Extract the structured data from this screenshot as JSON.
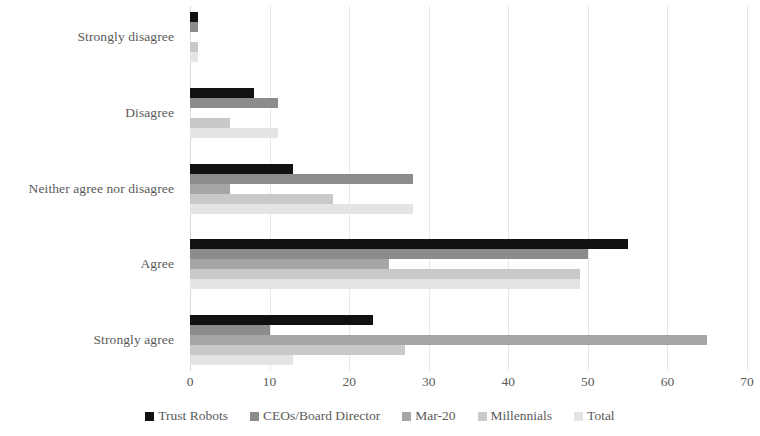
{
  "chart_data": {
    "type": "bar",
    "orientation": "horizontal",
    "title": "",
    "subtitle": "",
    "xlabel": "",
    "ylabel": "",
    "xlim": [
      0,
      70
    ],
    "xticks": [
      0,
      10,
      20,
      30,
      40,
      50,
      60,
      70
    ],
    "xtick_labels": [
      "0",
      "10",
      "20",
      "30",
      "40",
      "50",
      "60",
      "70"
    ],
    "grid": true,
    "grid_axis": "x",
    "legend_position": "bottom",
    "categories": [
      "Strongly disagree",
      "Disagree",
      "Neither agree nor disagree",
      "Agree",
      "Strongly agree"
    ],
    "series": [
      {
        "name": "Trust Robots",
        "color": "#111111",
        "values": [
          1,
          8,
          13,
          55,
          23
        ]
      },
      {
        "name": "CEOs/Board Director",
        "color": "#8c8c8c",
        "values": [
          1,
          11,
          28,
          50,
          10
        ]
      },
      {
        "name": "Mar-20",
        "color": "#a6a6a6",
        "values": [
          0,
          0,
          5,
          25,
          65
        ]
      },
      {
        "name": "Millennials",
        "color": "#c9c9c9",
        "values": [
          1,
          5,
          18,
          49,
          27
        ]
      },
      {
        "name": "Total",
        "color": "#e4e4e4",
        "values": [
          1,
          11,
          28,
          49,
          13
        ]
      }
    ]
  },
  "legend": {
    "items": [
      {
        "label": "Trust Robots"
      },
      {
        "label": "CEOs/Board Director"
      },
      {
        "label": "Mar-20"
      },
      {
        "label": "Millennials"
      },
      {
        "label": "Total"
      }
    ]
  }
}
